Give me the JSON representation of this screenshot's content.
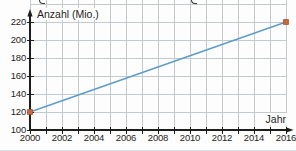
{
  "chart_data": {
    "type": "line",
    "title": "",
    "xlabel": "Jahr",
    "ylabel": "Anzahl (Mio.)",
    "series": [
      {
        "name": "Anzahl",
        "x": [
          2000,
          2016
        ],
        "y": [
          120,
          220
        ]
      }
    ],
    "xlim": [
      2000,
      2016
    ],
    "ylim": [
      100,
      220
    ],
    "grid": true,
    "grid_ylim": [
      100,
      240
    ],
    "x_minor_tick_step": 1,
    "x_major_tick_step": 2,
    "y_tick_step": 20,
    "x_tick_labels": [
      "2000",
      "2002",
      "2004",
      "2006",
      "2008",
      "2010",
      "2012",
      "2014",
      "2016"
    ],
    "y_tick_labels": [
      "220",
      "200",
      "180",
      "160",
      "140",
      "120",
      "100"
    ],
    "legend_position": "none",
    "colors": {
      "line": "#5d9cc8",
      "marker": "#c9683a",
      "marker_stroke": "#a8532c",
      "grid": "#c3cad0",
      "axis": "#1d1d1b",
      "text": "#1d1d1b",
      "background": "#fdfdfd"
    }
  }
}
